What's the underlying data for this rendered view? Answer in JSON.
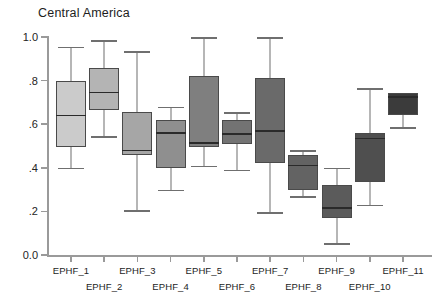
{
  "chart_data": {
    "type": "box",
    "title": "Central America",
    "xlabel": "",
    "ylabel": "",
    "ylim": [
      0.0,
      1.0
    ],
    "grid": false,
    "legend": null,
    "y_ticks": [
      {
        "value": 1.0,
        "label": "1.0"
      },
      {
        "value": 0.8,
        "label": ".8"
      },
      {
        "value": 0.6,
        "label": ".6"
      },
      {
        "value": 0.4,
        "label": ".4"
      },
      {
        "value": 0.2,
        "label": ".2"
      },
      {
        "value": 0.0,
        "label": "0.0"
      }
    ],
    "categories": [
      "EPHF_1",
      "EPHF_2",
      "EPHF_3",
      "EPHF_4",
      "EPHF_5",
      "EPHF_6",
      "EPHF_7",
      "EPHF_8",
      "EPHF_9",
      "EPHF_10",
      "EPHF_11"
    ],
    "boxes": [
      {
        "category": "EPHF_1",
        "whisker_low": 0.4,
        "q1": 0.495,
        "median": 0.64,
        "q3": 0.8,
        "whisker_high": 0.955,
        "color": "#cbcbcb"
      },
      {
        "category": "EPHF_2",
        "whisker_low": 0.545,
        "q1": 0.665,
        "median": 0.745,
        "q3": 0.86,
        "whisker_high": 0.985,
        "color": "#b4b4b4"
      },
      {
        "category": "EPHF_3",
        "whisker_low": 0.205,
        "q1": 0.46,
        "median": 0.48,
        "q3": 0.655,
        "whisker_high": 0.935,
        "color": "#a6a6a6"
      },
      {
        "category": "EPHF_4",
        "whisker_low": 0.3,
        "q1": 0.4,
        "median": 0.56,
        "q3": 0.62,
        "whisker_high": 0.68,
        "color": "#8f8f8f"
      },
      {
        "category": "EPHF_5",
        "whisker_low": 0.41,
        "q1": 0.495,
        "median": 0.515,
        "q3": 0.82,
        "whisker_high": 1.0,
        "color": "#7f7f7f"
      },
      {
        "category": "EPHF_6",
        "whisker_low": 0.39,
        "q1": 0.51,
        "median": 0.555,
        "q3": 0.62,
        "whisker_high": 0.655,
        "color": "#737373"
      },
      {
        "category": "EPHF_7",
        "whisker_low": 0.195,
        "q1": 0.42,
        "median": 0.57,
        "q3": 0.81,
        "whisker_high": 1.0,
        "color": "#6a6a6a"
      },
      {
        "category": "EPHF_8",
        "whisker_low": 0.27,
        "q1": 0.3,
        "median": 0.41,
        "q3": 0.46,
        "whisker_high": 0.48,
        "color": "#636363"
      },
      {
        "category": "EPHF_9",
        "whisker_low": 0.055,
        "q1": 0.17,
        "median": 0.215,
        "q3": 0.32,
        "whisker_high": 0.4,
        "color": "#5b5b5b"
      },
      {
        "category": "EPHF_10",
        "whisker_low": 0.23,
        "q1": 0.335,
        "median": 0.535,
        "q3": 0.56,
        "whisker_high": 0.765,
        "color": "#4f4f4f"
      },
      {
        "category": "EPHF_11",
        "whisker_low": 0.585,
        "q1": 0.64,
        "median": 0.725,
        "q3": 0.745,
        "whisker_high": 0.745,
        "color": "#3b3b3b"
      }
    ]
  }
}
